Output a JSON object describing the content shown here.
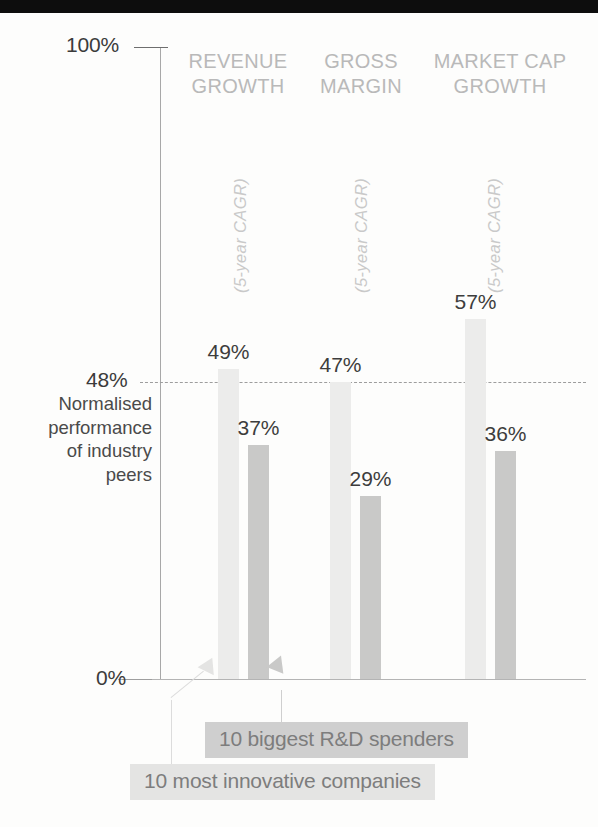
{
  "figure": {
    "top_band": true,
    "background": "#fdfdfc"
  },
  "axis": {
    "max_label": "100%",
    "min_label": "0%",
    "reference_label": "48%",
    "y_axis_caption": "Normalised\nperformance\nof industry\npeers",
    "y_axis_caption_lines": [
      "Normalised",
      "performance",
      "of industry",
      "peers"
    ]
  },
  "columns": [
    {
      "header": "REVENUE\nGROWTH",
      "caption": "(5-year CAGR)"
    },
    {
      "header": "GROSS\nMARGIN",
      "caption": "(5-year CAGR)"
    },
    {
      "header": "MARKET CAP\nGROWTH",
      "caption": "(5-year CAGR)"
    }
  ],
  "legend": {
    "rd_spenders": "10 biggest R&D spenders",
    "innovative": "10 most innovative companies"
  },
  "values": {
    "revenue_innovative": "49%",
    "revenue_rd": "37%",
    "margin_innovative": "47%",
    "margin_rd": "29%",
    "marketcap_innovative": "57%",
    "marketcap_rd": "36%"
  },
  "colors": {
    "innovative_bar": "#ececeb",
    "rd_bar": "#c9c9c8",
    "reference_line": "#9d9d9d",
    "header_text": "#b9b9b9",
    "value_text": "#3d3d3d",
    "top_band": "#0d0d0d"
  },
  "chart_data": {
    "type": "bar",
    "title": "",
    "subtitle": "",
    "xlabel": "",
    "ylabel": "Normalised performance of industry peers",
    "ylim": [
      0,
      100
    ],
    "ytick_labels": [
      "0%",
      "48%",
      "100%"
    ],
    "ytick_values": [
      0,
      48,
      100
    ],
    "grid": false,
    "legend_position": "bottom",
    "reference_lines": [
      {
        "value": 48,
        "label": "48%",
        "style": "dashed",
        "color": "#9d9d9d"
      }
    ],
    "annotations": [
      "(5-year CAGR)",
      "(5-year CAGR)",
      "(5-year CAGR)"
    ],
    "categories": [
      "REVENUE GROWTH",
      "GROSS MARGIN",
      "MARKET CAP GROWTH"
    ],
    "series": [
      {
        "name": "10 most innovative companies",
        "color": "#ececeb",
        "values": [
          49,
          47,
          57
        ],
        "labels": [
          "49%",
          "47%",
          "57%"
        ]
      },
      {
        "name": "10 biggest R&D spenders",
        "color": "#c9c9c8",
        "values": [
          37,
          29,
          36
        ],
        "labels": [
          "37%",
          "29%",
          "36%"
        ]
      }
    ]
  }
}
